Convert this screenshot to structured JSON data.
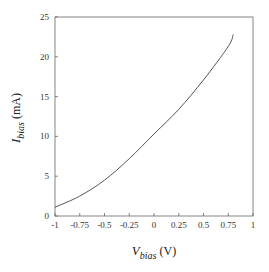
{
  "chart_data": {
    "type": "line",
    "title": "",
    "xlabel": "V_bias (V)",
    "ylabel": "I_bias (mA)",
    "xlabel_parts": {
      "symbol": "V",
      "subscript": "bias",
      "unit": " (V)"
    },
    "ylabel_parts": {
      "symbol": "I",
      "subscript": "bias",
      "unit": " (mA)"
    },
    "xlim": [
      -1,
      1
    ],
    "ylim": [
      0,
      25
    ],
    "x_ticks": [
      -1,
      -0.75,
      -0.5,
      -0.25,
      0,
      0.25,
      0.5,
      0.75,
      1
    ],
    "x_tick_labels": [
      "-1",
      "-0.75",
      "-0.5",
      "-0.25",
      "0",
      "0.25",
      "0.5",
      "0.75",
      "1"
    ],
    "y_ticks": [
      0,
      5,
      10,
      15,
      20,
      25
    ],
    "y_tick_labels": [
      "0",
      "5",
      "10",
      "15",
      "20",
      "25"
    ],
    "grid": false,
    "legend": null,
    "series": [
      {
        "name": "I_bias",
        "color": "#555555",
        "x": [
          -1.0,
          -0.75,
          -0.5,
          -0.25,
          0.0,
          0.25,
          0.5,
          0.75,
          0.8
        ],
        "y": [
          1.1,
          2.5,
          4.5,
          7.2,
          10.3,
          13.4,
          17.1,
          21.3,
          22.8
        ]
      }
    ]
  }
}
